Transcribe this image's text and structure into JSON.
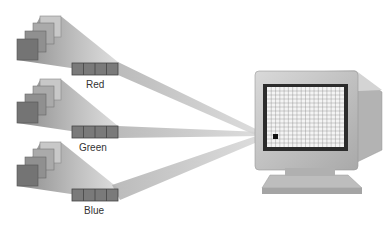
{
  "diagram": {
    "channels": [
      {
        "label": "Red",
        "label_x": 86,
        "label_y": 81
      },
      {
        "label": "Green",
        "label_x": 79,
        "label_y": 144
      },
      {
        "label": "Blue",
        "label_x": 84,
        "label_y": 207
      }
    ],
    "monitor": {
      "grid_cols": 18,
      "grid_rows": 15
    },
    "colors": {
      "beam": "#8a8a8a",
      "plane_dark": "#6e6e6e",
      "plane_light": "#c4c4c4",
      "register": "#7a7a7a",
      "monitor_body": "#c9c9c9",
      "screen_frame": "#2c2c2c"
    }
  }
}
